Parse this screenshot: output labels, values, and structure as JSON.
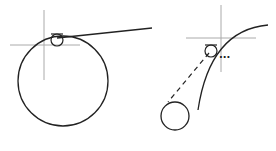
{
  "diagram": {
    "colors": {
      "stroke": "#222222",
      "crosshair": "#aaaaaa",
      "background": "#ffffff"
    },
    "left": {
      "crosshair": {
        "cx": 44,
        "cy": 45,
        "hlen": 36,
        "vtop": 10,
        "vbottom": 80
      },
      "big_circle": {
        "cx": 63,
        "cy": 81,
        "r": 45
      },
      "snap_marker": {
        "cx": 57,
        "cy": 40,
        "r": 6
      },
      "tangent_line": {
        "x1": 57,
        "y1": 38,
        "x2": 152,
        "y2": 28
      }
    },
    "right": {
      "crosshair": {
        "cx": 221,
        "cy": 38,
        "hlen": 36,
        "vtop": 5,
        "vbottom": 72
      },
      "arc": {
        "d": "M 268 25 Q 210 30 198 110"
      },
      "snap_marker": {
        "cx": 211,
        "cy": 51,
        "r": 6
      },
      "ellipsis": "...",
      "small_circle": {
        "cx": 175,
        "cy": 116,
        "r": 14
      },
      "dashed_line": {
        "x1": 209,
        "y1": 53,
        "x2": 168,
        "y2": 102
      }
    }
  }
}
